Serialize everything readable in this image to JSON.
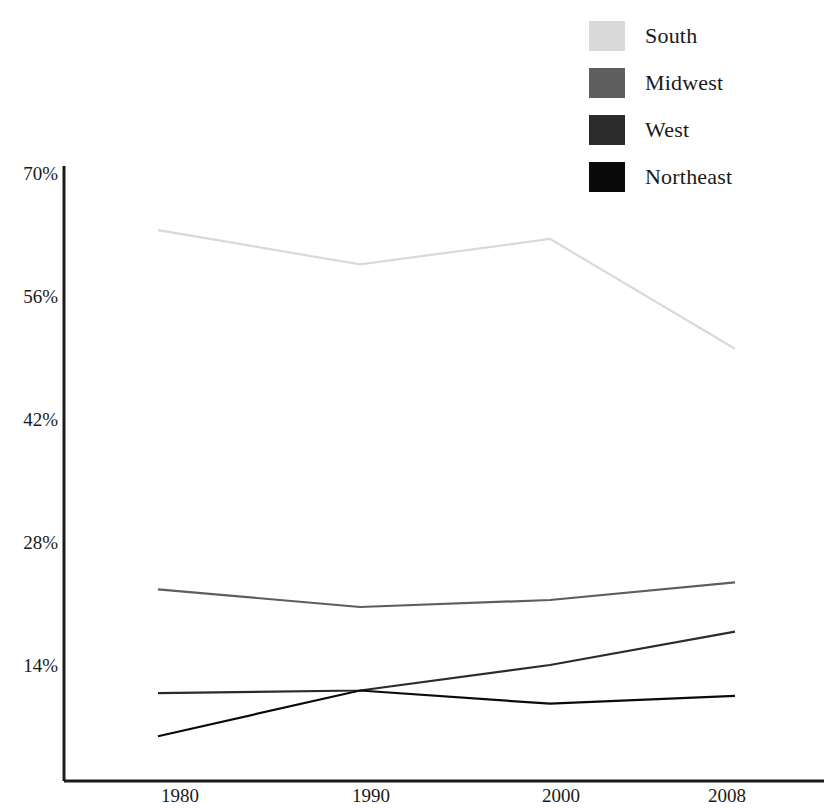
{
  "chart_data": {
    "type": "line",
    "title": "",
    "subtitle": "",
    "xlabel": "",
    "ylabel": "",
    "x": [
      "1980",
      "1990",
      "2000",
      "2008"
    ],
    "categories": [
      "1980",
      "1990",
      "2000",
      "2008"
    ],
    "xtick_labels": [
      "1980",
      "1990",
      "2000",
      "2008"
    ],
    "ytick_labels": [
      "70%",
      "56%",
      "42%",
      "28%",
      "14%"
    ],
    "ytick_values": [
      70,
      56,
      42,
      28,
      14
    ],
    "ylim": [
      0,
      70
    ],
    "xlim": [
      1978,
      2010
    ],
    "grid": false,
    "legend_position": "top-right",
    "series": [
      {
        "name": "South",
        "color": "#d9d9d9",
        "values": [
          63.5,
          59.6,
          62.5,
          50.0
        ]
      },
      {
        "name": "Midwest",
        "color": "#5e5e5e",
        "values": [
          22.6,
          20.6,
          21.4,
          23.4
        ]
      },
      {
        "name": "West",
        "color": "#2b2b2b",
        "values": [
          10.8,
          11.1,
          14.0,
          17.8
        ]
      },
      {
        "name": "Northeast",
        "color": "#0a0a0a",
        "values": [
          5.9,
          11.1,
          9.6,
          10.5
        ]
      }
    ]
  },
  "legend": {
    "items": [
      {
        "label": "South",
        "swatch_color": "#d9d9d9"
      },
      {
        "label": "Midwest",
        "swatch_color": "#5e5e5e"
      },
      {
        "label": "West",
        "swatch_color": "#2b2b2b"
      },
      {
        "label": "Northeast",
        "swatch_color": "#0a0a0a"
      }
    ]
  },
  "axes": {
    "axis_color": "#1a1a1a",
    "y_labels": [
      "70%",
      "56%",
      "42%",
      "28%",
      "14%"
    ],
    "x_labels": [
      "1980",
      "1990",
      "2000",
      "2008"
    ]
  }
}
